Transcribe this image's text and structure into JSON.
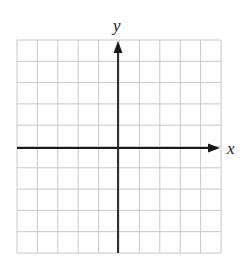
{
  "diagram": {
    "type": "coordinate-plane",
    "grid": {
      "columns": 10,
      "rows": 10,
      "left": 17,
      "top": 40,
      "right": 221,
      "bottom": 253,
      "line_color": "#c8c8c8"
    },
    "origin": {
      "x": 118,
      "y": 148
    },
    "axes": {
      "color": "#1a1a1a",
      "x_label": "x",
      "y_label": "y"
    }
  },
  "chart_data": {
    "type": "coordinate-grid",
    "title": "",
    "xlabel": "x",
    "ylabel": "y",
    "grid": true,
    "x_cells": 10,
    "y_cells": 10,
    "x_cells_left_of_origin": 5,
    "x_cells_right_of_origin": 5,
    "y_cells_above_origin": 5,
    "y_cells_below_origin": 5,
    "series": []
  }
}
